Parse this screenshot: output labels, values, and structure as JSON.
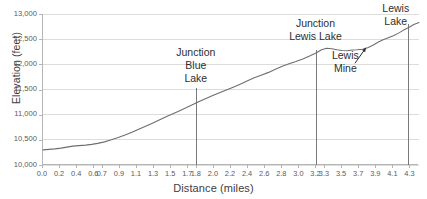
{
  "chart_data": {
    "type": "line",
    "title": "",
    "xlabel": "Distance (miles)",
    "ylabel": "Elevation (feet)",
    "xlim": [
      0.0,
      4.4
    ],
    "ylim": [
      10000,
      13000
    ],
    "grid": true,
    "legend": "none",
    "y_ticks": [
      {
        "value": 13000,
        "label": "13,000"
      },
      {
        "value": 12500,
        "label": "12,500"
      },
      {
        "value": 12000,
        "label": "12,000"
      },
      {
        "value": 11500,
        "label": "11,500"
      },
      {
        "value": 11000,
        "label": "11,000"
      },
      {
        "value": 10500,
        "label": "10,500"
      },
      {
        "value": 10000,
        "label": "10,000"
      }
    ],
    "x_ticks": [
      {
        "value": 0.0,
        "label": "0.0"
      },
      {
        "value": 0.2,
        "label": "0.2"
      },
      {
        "value": 0.4,
        "label": "0.4"
      },
      {
        "value": 0.6,
        "label": "0.6"
      },
      {
        "value": 0.7,
        "label": "0.7"
      },
      {
        "value": 0.9,
        "label": "0.9"
      },
      {
        "value": 1.1,
        "label": "1.1"
      },
      {
        "value": 1.3,
        "label": "1.3"
      },
      {
        "value": 1.5,
        "label": "1.5"
      },
      {
        "value": 1.7,
        "label": "1.7"
      },
      {
        "value": 1.8,
        "label": "1.8"
      },
      {
        "value": 2.0,
        "label": "2.0"
      },
      {
        "value": 2.2,
        "label": "2.2"
      },
      {
        "value": 2.4,
        "label": "2.4"
      },
      {
        "value": 2.6,
        "label": "2.6"
      },
      {
        "value": 2.8,
        "label": "2.8"
      },
      {
        "value": 3.0,
        "label": "3.0"
      },
      {
        "value": 3.2,
        "label": "3.2"
      },
      {
        "value": 3.3,
        "label": "3.3"
      },
      {
        "value": 3.5,
        "label": "3.5"
      },
      {
        "value": 3.7,
        "label": "3.7"
      },
      {
        "value": 3.9,
        "label": "3.9"
      },
      {
        "value": 4.1,
        "label": "4.1"
      },
      {
        "value": 4.3,
        "label": "4.3"
      }
    ],
    "series": [
      {
        "name": "elevation-profile",
        "color": "#6e6e6e",
        "x": [
          0.0,
          0.07,
          0.14,
          0.21,
          0.28,
          0.35,
          0.42,
          0.5,
          0.57,
          0.64,
          0.72,
          0.8,
          0.88,
          0.96,
          1.04,
          1.12,
          1.2,
          1.28,
          1.36,
          1.44,
          1.52,
          1.6,
          1.68,
          1.76,
          1.84,
          1.92,
          2.0,
          2.08,
          2.16,
          2.24,
          2.32,
          2.4,
          2.48,
          2.56,
          2.64,
          2.72,
          2.8,
          2.88,
          2.96,
          3.04,
          3.12,
          3.2,
          3.26,
          3.32,
          3.38,
          3.44,
          3.5,
          3.56,
          3.62,
          3.68,
          3.74,
          3.8,
          3.86,
          3.92,
          3.98,
          4.04,
          4.1,
          4.16,
          4.22,
          4.28,
          4.34,
          4.4
        ],
        "y": [
          10300,
          10310,
          10320,
          10335,
          10355,
          10375,
          10385,
          10395,
          10410,
          10430,
          10460,
          10500,
          10545,
          10595,
          10650,
          10710,
          10770,
          10830,
          10895,
          10960,
          11020,
          11080,
          11140,
          11205,
          11270,
          11330,
          11390,
          11445,
          11500,
          11555,
          11615,
          11680,
          11740,
          11790,
          11840,
          11900,
          11960,
          12010,
          12055,
          12105,
          12165,
          12230,
          12290,
          12320,
          12310,
          12290,
          12275,
          12270,
          12285,
          12290,
          12300,
          12330,
          12380,
          12440,
          12490,
          12530,
          12570,
          12620,
          12680,
          12730,
          12790,
          12830
        ]
      }
    ],
    "markers": [
      {
        "name": "junction-blue-lake",
        "x": 1.8,
        "label_lines": [
          "Junction",
          "Blue",
          "Lake"
        ],
        "line_top_value": 11520
      },
      {
        "name": "junction-lewis-lake",
        "x": 3.2,
        "label_lines": [
          "Junction",
          "Lewis Lake"
        ],
        "line_top_value": 12280
      },
      {
        "name": "lewis-lake",
        "x": 4.28,
        "label_lines": [
          "Lewis",
          "Lake"
        ],
        "line_top_value": 12800
      }
    ],
    "annotations": [
      {
        "name": "lewis-mine",
        "label_lines": [
          "Lewis",
          "Mine"
        ],
        "x": 3.55,
        "y": 11900,
        "arrow_to_x": 3.78,
        "arrow_to_y": 12330
      }
    ]
  }
}
